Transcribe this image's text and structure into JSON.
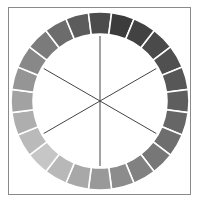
{
  "diagram": {
    "type": "grayscale-color-wheel",
    "segment_count": 24,
    "spoke_count": 6,
    "center": [
      100,
      101
    ],
    "outer_radius": 89,
    "inner_radius": 67,
    "spoke_radius": 65,
    "segment_gap_color": "#ffffff",
    "spoke_color": "#444444",
    "frame_color": "#8a8a8a",
    "darkest_angle_deg": -60,
    "segments": [
      {
        "index": 0,
        "fill": "#4a4a4a"
      },
      {
        "index": 1,
        "fill": "#505050"
      },
      {
        "index": 2,
        "fill": "#575757"
      },
      {
        "index": 3,
        "fill": "#5e5e5e"
      },
      {
        "index": 4,
        "fill": "#666666"
      },
      {
        "index": 5,
        "fill": "#6e6e6e"
      },
      {
        "index": 6,
        "fill": "#777777"
      },
      {
        "index": 7,
        "fill": "#818181"
      },
      {
        "index": 8,
        "fill": "#8c8c8c"
      },
      {
        "index": 9,
        "fill": "#999999"
      },
      {
        "index": 10,
        "fill": "#a8a8a8"
      },
      {
        "index": 11,
        "fill": "#b8b8b8"
      },
      {
        "index": 12,
        "fill": "#c6c6c6"
      },
      {
        "index": 13,
        "fill": "#bababa"
      },
      {
        "index": 14,
        "fill": "#aeaeae"
      },
      {
        "index": 15,
        "fill": "#a2a2a2"
      },
      {
        "index": 16,
        "fill": "#959595"
      },
      {
        "index": 17,
        "fill": "#888888"
      },
      {
        "index": 18,
        "fill": "#7b7b7b"
      },
      {
        "index": 19,
        "fill": "#6c6c6c"
      },
      {
        "index": 20,
        "fill": "#5c5c5c"
      },
      {
        "index": 21,
        "fill": "#4c4c4c"
      },
      {
        "index": 22,
        "fill": "#3c3c3c"
      },
      {
        "index": 23,
        "fill": "#424242"
      }
    ]
  }
}
